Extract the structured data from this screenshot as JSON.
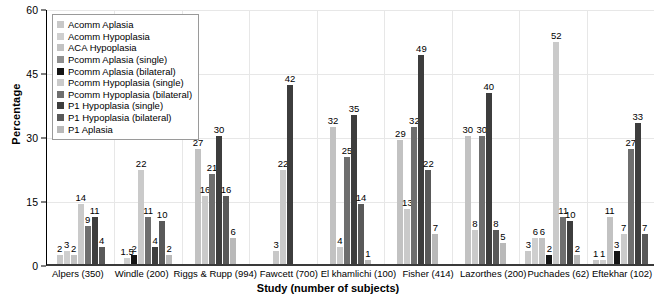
{
  "chart_data": {
    "type": "bar",
    "title": "",
    "xlabel": "Study (number of subjects)",
    "ylabel": "Percentage",
    "ylim": [
      0,
      60
    ],
    "yticks": [
      0,
      15,
      30,
      45,
      60
    ],
    "grid": true,
    "legend_position": "top-left",
    "categories": [
      "Alpers (350)",
      "Windle (200)",
      "Riggs & Rupp (994)",
      "Fawcett (700)",
      "El khamlichi (100)",
      "Fisher (414)",
      "Lazorthes (200)",
      "Puchades (62)",
      "Eftekhar (102)"
    ],
    "series": [
      {
        "name": "Acomm Aplasia",
        "color": "#c8c8c8",
        "values": [
          2,
          null,
          null,
          3,
          null,
          null,
          null,
          3,
          1
        ]
      },
      {
        "name": "Acomm Hypoplasia",
        "color": "#cfcfcf",
        "values": [
          3,
          1.5,
          null,
          null,
          null,
          null,
          null,
          6,
          1
        ]
      },
      {
        "name": "ACA Hypoplasia",
        "color": "#c2c2c2",
        "values": [
          2,
          null,
          27,
          null,
          32,
          29,
          30,
          6,
          11
        ]
      },
      {
        "name": "Pcomm Aplasia (single)",
        "color": "#8f8f8f",
        "values": [
          null,
          null,
          null,
          null,
          null,
          null,
          null,
          null,
          null
        ]
      },
      {
        "name": "Pcomm Aplasia (bilateral)",
        "color": "#151515",
        "values": [
          null,
          2,
          null,
          null,
          null,
          null,
          null,
          2,
          3
        ]
      },
      {
        "name": "Pcomm Hypoplasia (single)",
        "color": "#cacaca",
        "values": [
          14,
          22,
          16,
          22,
          4,
          13,
          8,
          52,
          7
        ]
      },
      {
        "name": "Pcomm Hypoplasia (bilateral)",
        "color": "#6e6e6e",
        "values": [
          9,
          11,
          21,
          null,
          25,
          32,
          30,
          11,
          27
        ]
      },
      {
        "name": "P1 Hypoplasia (single)",
        "color": "#3d3d3d",
        "values": [
          11,
          4,
          30,
          42,
          35,
          49,
          40,
          10,
          33
        ]
      },
      {
        "name": "P1 Hypoplasia (bilateral)",
        "color": "#595959",
        "values": [
          4,
          10,
          16,
          null,
          14,
          22,
          8,
          null,
          7
        ]
      },
      {
        "name": "P1 Aplasia",
        "color": "#b9b9b9",
        "values": [
          null,
          2,
          6,
          null,
          1,
          7,
          5,
          2,
          null
        ]
      }
    ]
  },
  "legend": {
    "items": [
      {
        "label": "Acomm Aplasia",
        "color": "#c8c8c8"
      },
      {
        "label": "Acomm Hypoplasia",
        "color": "#cfcfcf"
      },
      {
        "label": "ACA Hypoplasia",
        "color": "#c2c2c2"
      },
      {
        "label": "Pcomm Aplasia (single)",
        "color": "#8f8f8f"
      },
      {
        "label": "Pcomm Aplasia (bilateral)",
        "color": "#151515"
      },
      {
        "label": "Pcomm Hypoplasia (single)",
        "color": "#cacaca"
      },
      {
        "label": "Pcomm Hypoplasia (bilateral)",
        "color": "#6e6e6e"
      },
      {
        "label": "P1 Hypoplasia (single)",
        "color": "#3d3d3d"
      },
      {
        "label": "P1 Hypoplasia (bilateral)",
        "color": "#595959"
      },
      {
        "label": "P1 Aplasia",
        "color": "#b9b9b9"
      }
    ]
  }
}
